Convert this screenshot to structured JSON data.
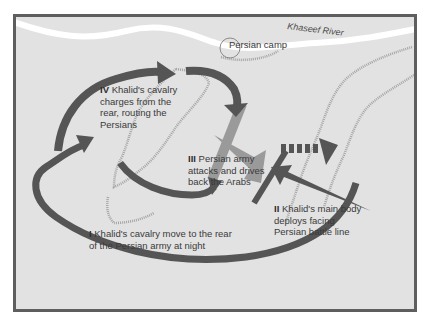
{
  "map": {
    "title": "Battle of Khaseef River - Khalid's maneuver",
    "colors": {
      "background": "#e2e2e2",
      "frame": "#5e5e5e",
      "arab_forces": "#555555",
      "persian_forces": "#9a9a9a",
      "river": "#ffffff",
      "ridges": "#a9a9a9",
      "text": "#3a3a3a"
    },
    "river": {
      "label": "Khaseef River"
    },
    "camp": {
      "label": "Persian camp"
    },
    "phases": [
      {
        "numeral": "I",
        "text_line1": "Khalid's cavalry move to the rear",
        "text_line2": "of the Persian army at night"
      },
      {
        "numeral": "II",
        "text_line1": "Khalid's main body",
        "text_line2": "deploys facing",
        "text_line3": "Persian battle line"
      },
      {
        "numeral": "III",
        "text_line1": "Persian army",
        "text_line2": "attacks and drives",
        "text_line3": "back the Arabs"
      },
      {
        "numeral": "IV",
        "text_line1": "Khalid's cavalry",
        "text_line2": "charges from the",
        "text_line3": "rear, routing  the",
        "text_line4": "Persians"
      }
    ],
    "legend_icons": {
      "arab_arrow": "dark-arrow-icon",
      "persian_arrow": "light-arrow-icon",
      "retreat_arrow": "dashed-arrow-icon",
      "persian_line": "persian-battle-line",
      "arab_line": "arab-battle-line",
      "camp": "camp-circle-icon"
    }
  }
}
